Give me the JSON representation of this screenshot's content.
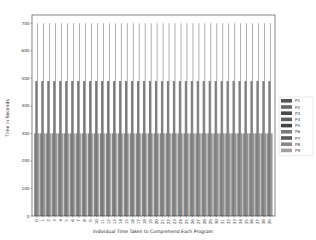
{
  "chart_data": {
    "type": "bar",
    "title": "",
    "xlabel": "Individual Time Taken to Comprehend Each Program",
    "ylabel": "Time in Seconds",
    "ylim": [
      0,
      730
    ],
    "yticks": [
      0,
      100,
      200,
      300,
      400,
      500,
      600,
      700
    ],
    "grid": false,
    "legend_position": "right-outside",
    "categories": [
      "0",
      "1",
      "2",
      "3",
      "4",
      "5",
      "6",
      "7",
      "8",
      "9",
      "10",
      "11",
      "12",
      "13",
      "14",
      "15",
      "16",
      "17",
      "18",
      "19",
      "20",
      "21",
      "22",
      "23",
      "24",
      "25",
      "26",
      "27",
      "28",
      "29",
      "30",
      "31",
      "32",
      "33",
      "34",
      "35",
      "36",
      "37",
      "38",
      "39"
    ],
    "series": [
      {
        "name": "P1",
        "color": "#555555",
        "values": [
          300,
          300,
          300,
          300,
          300,
          300,
          300,
          300,
          300,
          300,
          300,
          300,
          300,
          300,
          300,
          300,
          300,
          300,
          300,
          300,
          300,
          300,
          300,
          300,
          300,
          300,
          300,
          300,
          300,
          300,
          300,
          300,
          300,
          300,
          300,
          300,
          300,
          300,
          300,
          300
        ]
      },
      {
        "name": "P2",
        "color": "#6a6a6a",
        "values": [
          300,
          300,
          300,
          300,
          300,
          300,
          300,
          300,
          300,
          300,
          300,
          300,
          300,
          300,
          300,
          300,
          300,
          300,
          300,
          300,
          300,
          300,
          300,
          300,
          300,
          300,
          300,
          300,
          300,
          300,
          300,
          300,
          300,
          300,
          300,
          300,
          300,
          300,
          300,
          300
        ]
      },
      {
        "name": "P3",
        "color": "#4a4a4a",
        "values": [
          490,
          490,
          490,
          490,
          490,
          490,
          490,
          490,
          490,
          490,
          490,
          490,
          490,
          490,
          490,
          490,
          490,
          490,
          490,
          490,
          490,
          490,
          490,
          490,
          490,
          490,
          490,
          490,
          490,
          490,
          490,
          490,
          490,
          490,
          490,
          490,
          490,
          490,
          490,
          490
        ]
      },
      {
        "name": "P4",
        "color": "#5e5e5e",
        "values": [
          490,
          490,
          490,
          490,
          490,
          490,
          490,
          490,
          490,
          490,
          490,
          490,
          490,
          490,
          490,
          490,
          490,
          490,
          490,
          490,
          490,
          490,
          490,
          490,
          490,
          490,
          490,
          490,
          490,
          490,
          490,
          490,
          490,
          490,
          490,
          490,
          490,
          490,
          490,
          490
        ]
      },
      {
        "name": "P5",
        "color": "#444444",
        "values": [
          490,
          490,
          490,
          490,
          490,
          490,
          490,
          490,
          490,
          490,
          490,
          490,
          490,
          490,
          490,
          490,
          490,
          490,
          490,
          490,
          490,
          490,
          490,
          490,
          490,
          490,
          490,
          490,
          490,
          490,
          490,
          490,
          490,
          490,
          490,
          490,
          490,
          490,
          490,
          490
        ]
      },
      {
        "name": "P6",
        "color": "#7a7a7a",
        "values": [
          700,
          700,
          700,
          700,
          700,
          700,
          700,
          700,
          700,
          700,
          700,
          700,
          700,
          700,
          700,
          700,
          700,
          700,
          700,
          700,
          700,
          700,
          700,
          700,
          700,
          700,
          700,
          700,
          700,
          700,
          700,
          700,
          700,
          700,
          700,
          700,
          700,
          700,
          700,
          700
        ]
      },
      {
        "name": "P7",
        "color": "#5a5a5a",
        "values": [
          300,
          300,
          300,
          300,
          300,
          300,
          300,
          300,
          300,
          300,
          300,
          300,
          300,
          300,
          300,
          300,
          300,
          300,
          300,
          300,
          300,
          300,
          300,
          300,
          300,
          300,
          300,
          300,
          300,
          300,
          300,
          300,
          300,
          300,
          300,
          300,
          300,
          300,
          300,
          300
        ]
      },
      {
        "name": "P8",
        "color": "#888888",
        "values": [
          300,
          300,
          300,
          300,
          300,
          300,
          300,
          300,
          300,
          300,
          300,
          300,
          300,
          300,
          300,
          300,
          300,
          300,
          300,
          300,
          300,
          300,
          300,
          300,
          300,
          300,
          300,
          300,
          300,
          300,
          300,
          300,
          300,
          300,
          300,
          300,
          300,
          300,
          300,
          300
        ]
      },
      {
        "name": "P9",
        "color": "#a0a0a0",
        "values": [
          300,
          300,
          300,
          300,
          300,
          300,
          300,
          300,
          300,
          300,
          300,
          300,
          300,
          300,
          300,
          300,
          300,
          300,
          300,
          300,
          300,
          300,
          300,
          300,
          300,
          300,
          300,
          300,
          300,
          300,
          300,
          300,
          300,
          300,
          300,
          300,
          300,
          300,
          300,
          300
        ]
      }
    ]
  }
}
